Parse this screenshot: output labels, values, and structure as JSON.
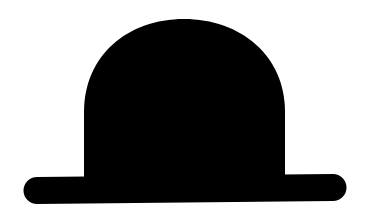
{
  "image": {
    "subject": "bowler hat silhouette",
    "background_color": "#ffffff",
    "fill_color": "#000000"
  },
  "shapes": {
    "crown": {
      "left": 83,
      "right": 286,
      "top": 19,
      "side_start": 100,
      "bottom": 178
    },
    "brim": {
      "left": 23,
      "right": 346,
      "top_left": 177,
      "top_right": 174,
      "height": 27
    }
  }
}
